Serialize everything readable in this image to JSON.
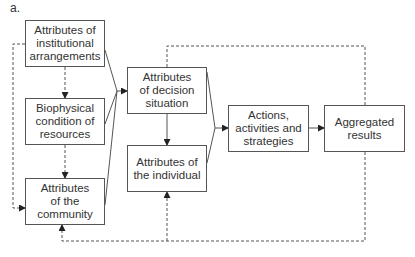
{
  "figure_label": "a.",
  "boxes": {
    "institutional": "Attributes of\ninstitutional\narrangements",
    "biophysical": "Biophysical\ncondition of\nresources",
    "community": "Attributes\nof the\ncommunity",
    "decision": "Attributes\nof decision\nsituation",
    "individual": "Attributes of\nthe individual",
    "actions": "Actions,\nactivities and\nstrategies",
    "aggregated": "Aggregated\nresults"
  },
  "colors": {
    "line": "#555555",
    "text": "#333333",
    "background": "#ffffff"
  }
}
